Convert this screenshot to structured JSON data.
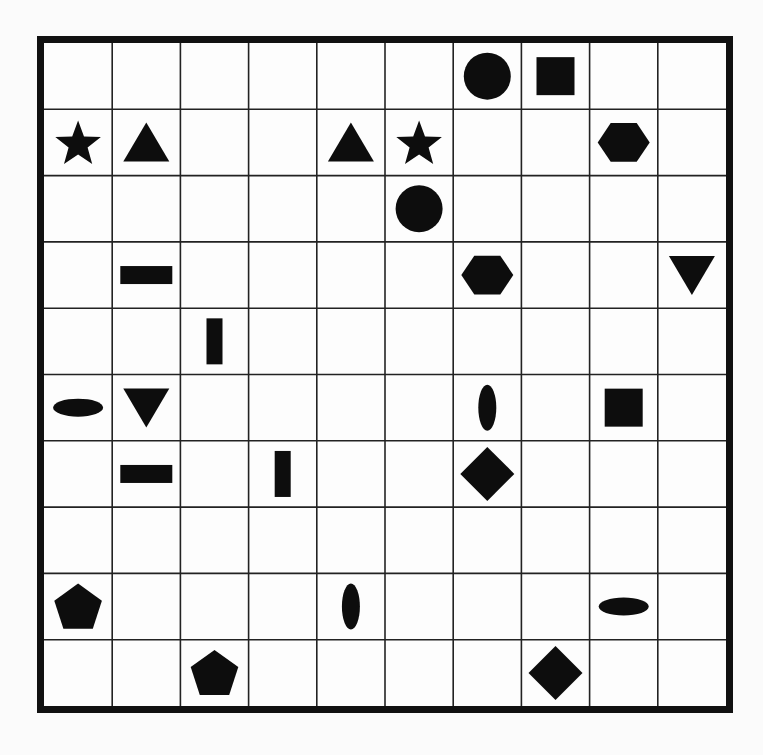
{
  "puzzle": {
    "rows": 10,
    "cols": 10,
    "colors": {
      "border": "#111111",
      "gridline": "#222222",
      "shape": "#0d0d0d",
      "background": "#fdfdfd"
    },
    "shapes": [
      {
        "row": 0,
        "col": 6,
        "type": "circle"
      },
      {
        "row": 0,
        "col": 7,
        "type": "square"
      },
      {
        "row": 1,
        "col": 0,
        "type": "star"
      },
      {
        "row": 1,
        "col": 1,
        "type": "triangle-up"
      },
      {
        "row": 1,
        "col": 4,
        "type": "triangle-up"
      },
      {
        "row": 1,
        "col": 5,
        "type": "star"
      },
      {
        "row": 1,
        "col": 8,
        "type": "hexagon"
      },
      {
        "row": 2,
        "col": 5,
        "type": "circle"
      },
      {
        "row": 3,
        "col": 1,
        "type": "bar-horizontal"
      },
      {
        "row": 3,
        "col": 6,
        "type": "hexagon"
      },
      {
        "row": 3,
        "col": 9,
        "type": "triangle-down"
      },
      {
        "row": 4,
        "col": 2,
        "type": "bar-vertical"
      },
      {
        "row": 5,
        "col": 0,
        "type": "ellipse-horizontal"
      },
      {
        "row": 5,
        "col": 1,
        "type": "triangle-down"
      },
      {
        "row": 5,
        "col": 6,
        "type": "ellipse-vertical"
      },
      {
        "row": 5,
        "col": 8,
        "type": "square"
      },
      {
        "row": 6,
        "col": 1,
        "type": "bar-horizontal"
      },
      {
        "row": 6,
        "col": 3,
        "type": "bar-vertical"
      },
      {
        "row": 6,
        "col": 6,
        "type": "diamond"
      },
      {
        "row": 8,
        "col": 0,
        "type": "pentagon"
      },
      {
        "row": 8,
        "col": 4,
        "type": "ellipse-vertical"
      },
      {
        "row": 8,
        "col": 8,
        "type": "ellipse-horizontal"
      },
      {
        "row": 9,
        "col": 2,
        "type": "pentagon"
      },
      {
        "row": 9,
        "col": 7,
        "type": "diamond"
      }
    ]
  }
}
